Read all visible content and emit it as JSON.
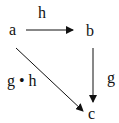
{
  "diagram": {
    "nodes": {
      "a": "a",
      "b": "b",
      "c": "c"
    },
    "arrows": [
      {
        "from": "a",
        "to": "b",
        "label": "h"
      },
      {
        "from": "b",
        "to": "c",
        "label": "g"
      },
      {
        "from": "a",
        "to": "c",
        "label": "g • h"
      }
    ]
  }
}
